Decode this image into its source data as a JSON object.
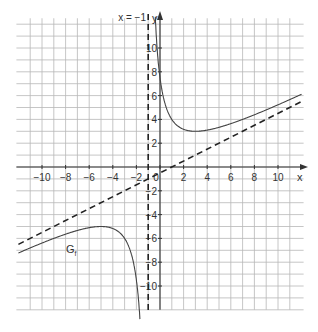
{
  "chart_data": {
    "type": "line",
    "title": "",
    "xlabel": "x",
    "ylabel": "y",
    "xlim": [
      -12,
      12
    ],
    "ylim": [
      -12,
      12.5
    ],
    "grid": true,
    "grid_step": 1,
    "x_ticks": [
      -10,
      -8,
      -6,
      -4,
      -2,
      0,
      2,
      4,
      6,
      8,
      10
    ],
    "x_tick_labels": [
      "−10",
      "−8",
      "−6",
      "−4",
      "−2",
      "0",
      "2",
      "4",
      "6",
      "8",
      "10"
    ],
    "y_ticks": [
      10,
      8,
      6,
      4,
      2,
      -2,
      -4,
      -6,
      -8,
      -10
    ],
    "y_tick_labels": [
      "10",
      "8",
      "6",
      "4",
      "2",
      "−2",
      "−4",
      "−6",
      "−8",
      "−10"
    ],
    "series": [
      {
        "name": "G_f",
        "label": "G",
        "label_subscript": "f",
        "style": "solid",
        "formula": "f(x) = 0.5x - 0.5 + 8/(x+1)",
        "x": [
          -12,
          -10,
          -8,
          -6,
          -5,
          -4,
          -3,
          -2,
          -1.5,
          -1.3
        ],
        "y": [
          -7.27,
          -6.39,
          -5.64,
          -5.1,
          -5.0,
          -5.17,
          -6.0,
          -9.5,
          -17.25,
          -27.3
        ]
      },
      {
        "name": "G_f right branch",
        "style": "solid",
        "x": [
          -0.3,
          0,
          1,
          2,
          3,
          4,
          6,
          8,
          10,
          12
        ],
        "y": [
          10.88,
          7.5,
          4.0,
          3.17,
          3.0,
          3.1,
          3.64,
          4.39,
          5.23,
          6.12
        ]
      },
      {
        "name": "oblique asymptote",
        "style": "dashed",
        "formula": "y = 0.5x - 0.5",
        "x": [
          -12,
          12
        ],
        "y": [
          -6.5,
          5.5
        ]
      },
      {
        "name": "vertical asymptote",
        "label": "x = −1",
        "style": "dashed",
        "x": [
          -1,
          -1
        ],
        "y": [
          -12.5,
          12.5
        ]
      }
    ],
    "annotations": [
      {
        "text": "x = −1",
        "at": [
          -1,
          12
        ]
      },
      {
        "text": "G_f",
        "at": [
          -7,
          -6.3
        ]
      }
    ]
  }
}
